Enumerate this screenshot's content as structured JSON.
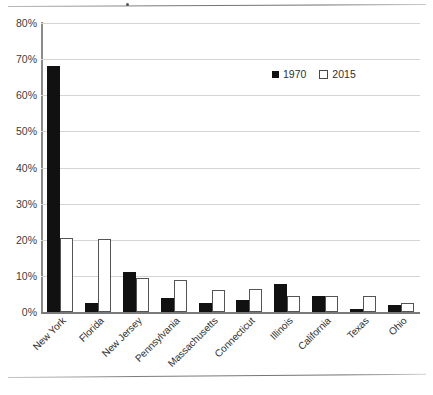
{
  "chart_data": {
    "type": "bar",
    "title": "",
    "xlabel": "",
    "ylabel": "",
    "ylim": [
      0,
      80
    ],
    "ytick_labels": [
      "80%",
      "70%",
      "60%",
      "50%",
      "40%",
      "30%",
      "20%",
      "10%",
      "0%"
    ],
    "ytick_values": [
      80,
      70,
      60,
      50,
      40,
      30,
      20,
      10,
      0
    ],
    "ytick_suffix": "%",
    "grid": true,
    "legend_position": "top-right",
    "categories": [
      "New York",
      "Florida",
      "New Jersey",
      "Pennsylvania",
      "Massachusetts",
      "Connecticut",
      "Illinois",
      "California",
      "Texas",
      "Ohio"
    ],
    "series": [
      {
        "name": "1970",
        "color": "#111111",
        "style": "filled",
        "values": [
          68.0,
          2.5,
          11.0,
          3.8,
          2.5,
          3.3,
          7.8,
          4.3,
          0.9,
          2.0
        ]
      },
      {
        "name": "2015",
        "color": "#ffffff",
        "style": "hollow",
        "values": [
          20.5,
          20.3,
          9.5,
          8.8,
          6.0,
          6.3,
          4.3,
          4.3,
          4.3,
          2.5
        ]
      }
    ]
  },
  "legend": {
    "entries": [
      {
        "label": "1970",
        "marker": "filled-square"
      },
      {
        "label": "2015",
        "marker": "hollow-square"
      }
    ]
  }
}
